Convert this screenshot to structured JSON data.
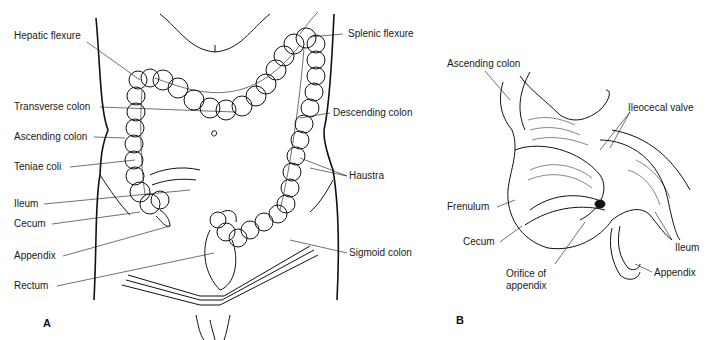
{
  "panel_a": {
    "letter": "A",
    "labels_left": [
      {
        "id": "hepatic-flexure",
        "text": "Hepatic flexure",
        "x": 14,
        "y": 36
      },
      {
        "id": "transverse-colon",
        "text": "Transverse colon",
        "x": 14,
        "y": 101
      },
      {
        "id": "ascending-colon",
        "text": "Ascending colon",
        "x": 14,
        "y": 131
      },
      {
        "id": "teniae-coli",
        "text": "Teniae coli",
        "x": 14,
        "y": 161
      },
      {
        "id": "ileum",
        "text": "Ileum",
        "x": 14,
        "y": 198
      },
      {
        "id": "cecum",
        "text": "Cecum",
        "x": 14,
        "y": 218
      },
      {
        "id": "appendix",
        "text": "Appendix",
        "x": 14,
        "y": 250
      },
      {
        "id": "rectum",
        "text": "Rectum",
        "x": 14,
        "y": 280
      }
    ],
    "labels_right": [
      {
        "id": "splenic-flexure",
        "text": "Splenic flexure",
        "x": 348,
        "y": 28
      },
      {
        "id": "descending-colon",
        "text": "Descending colon",
        "x": 333,
        "y": 107
      },
      {
        "id": "haustra",
        "text": "Haustra",
        "x": 349,
        "y": 170
      },
      {
        "id": "sigmoid-colon",
        "text": "Sigmoid colon",
        "x": 349,
        "y": 247
      }
    ]
  },
  "panel_b": {
    "letter": "B",
    "labels": [
      {
        "id": "ascending-colon-b",
        "text": "Ascending colon",
        "x": 447,
        "y": 57
      },
      {
        "id": "ileocecal-valve",
        "text": "Ileocecal valve",
        "x": 628,
        "y": 102
      },
      {
        "id": "frenulum",
        "text": "Frenulum",
        "x": 447,
        "y": 202
      },
      {
        "id": "cecum-b",
        "text": "Cecum",
        "x": 463,
        "y": 237
      },
      {
        "id": "ileum-b",
        "text": "Ileum",
        "x": 674,
        "y": 242
      },
      {
        "id": "appendix-b",
        "text": "Appendix",
        "x": 654,
        "y": 267
      },
      {
        "id": "orifice-of-appendix-1",
        "text": "Orifice of",
        "x": 506,
        "y": 268
      },
      {
        "id": "orifice-of-appendix-2",
        "text": "appendix",
        "x": 506,
        "y": 280
      }
    ]
  }
}
